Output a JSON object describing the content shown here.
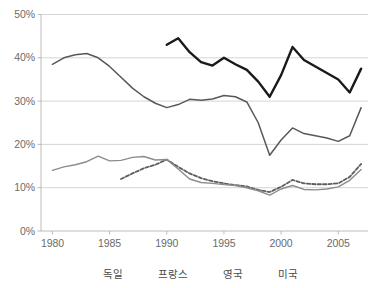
{
  "chart_data": {
    "type": "line",
    "title": "",
    "subtitle": "",
    "xlabel": "",
    "ylabel": "",
    "xlim": [
      1979.0,
      2007.6
    ],
    "ylim": [
      0,
      50
    ],
    "y_tick_labels": [
      "0%",
      "10%",
      "20%",
      "30%",
      "40%",
      "50%"
    ],
    "y_tick_values": [
      0,
      10,
      20,
      30,
      40,
      50
    ],
    "x_tick_labels": [
      "1980",
      "1985",
      "1990",
      "1995",
      "2000",
      "2005"
    ],
    "x_tick_values": [
      1980,
      1985,
      1990,
      1995,
      2000,
      2005
    ],
    "grid": "horizontal",
    "legend_position": "bottom",
    "y_unit": "percent",
    "series": [
      {
        "name": "독일",
        "color": "#1a1a1a",
        "style": "solid",
        "width": 2.4,
        "x": [
          1990,
          1991,
          1992,
          1993,
          1994,
          1995,
          1996,
          1997,
          1998,
          1999,
          2000,
          2001,
          2002,
          2003,
          2004,
          2005,
          2006,
          2007
        ],
        "values": [
          43.0,
          44.5,
          41.3,
          39.0,
          38.2,
          40.0,
          38.5,
          37.2,
          34.5,
          31.0,
          36.0,
          42.5,
          39.5,
          38.0,
          36.5,
          35.0,
          32.0,
          37.5
        ]
      },
      {
        "name": "프랑스",
        "color": "#585858",
        "style": "solid",
        "width": 1.5,
        "x": [
          1980,
          1981,
          1982,
          1983,
          1984,
          1985,
          1986,
          1987,
          1988,
          1989,
          1990,
          1991,
          1992,
          1993,
          1994,
          1995,
          1996,
          1997,
          1998,
          1999,
          2000,
          2001,
          2002,
          2003,
          2004,
          2005,
          2006,
          2007
        ],
        "values": [
          38.5,
          40.0,
          40.7,
          41.0,
          40.0,
          38.0,
          35.5,
          33.0,
          31.0,
          29.5,
          28.5,
          29.2,
          30.4,
          30.2,
          30.5,
          31.3,
          31.0,
          29.8,
          25.0,
          17.5,
          21.0,
          23.8,
          22.5,
          22.0,
          21.5,
          20.7,
          22.0,
          28.5
        ]
      },
      {
        "name": "영국",
        "color": "#5e5e5e",
        "style": "dashed",
        "width": 1.8,
        "x": [
          1986,
          1987,
          1988,
          1989,
          1990,
          1991,
          1992,
          1993,
          1994,
          1995,
          1996,
          1997,
          1998,
          1999,
          2000,
          2001,
          2002,
          2003,
          2004,
          2005,
          2006,
          2007
        ],
        "values": [
          12.0,
          13.3,
          14.5,
          15.3,
          16.5,
          14.8,
          13.3,
          12.2,
          11.5,
          11.0,
          10.6,
          10.3,
          9.5,
          9.0,
          10.2,
          11.8,
          11.0,
          10.8,
          10.8,
          11.0,
          12.5,
          15.5
        ]
      },
      {
        "name": "미국",
        "color": "#8c8c8c",
        "style": "solid",
        "width": 1.4,
        "x": [
          1980,
          1981,
          1982,
          1983,
          1984,
          1985,
          1986,
          1987,
          1988,
          1989,
          1990,
          1991,
          1992,
          1993,
          1994,
          1995,
          1996,
          1997,
          1998,
          1999,
          2000,
          2001,
          2002,
          2003,
          2004,
          2005,
          2006,
          2007
        ],
        "values": [
          14.0,
          14.8,
          15.3,
          16.0,
          17.3,
          16.2,
          16.3,
          17.0,
          17.2,
          16.4,
          16.5,
          14.3,
          12.0,
          11.2,
          11.0,
          10.7,
          10.5,
          10.0,
          9.3,
          8.3,
          9.7,
          10.5,
          9.6,
          9.5,
          9.7,
          10.2,
          11.7,
          14.2
        ]
      }
    ]
  },
  "legend": {
    "items": [
      {
        "label": "독일"
      },
      {
        "label": "프랑스"
      },
      {
        "label": "영국"
      },
      {
        "label": "미국"
      }
    ]
  }
}
